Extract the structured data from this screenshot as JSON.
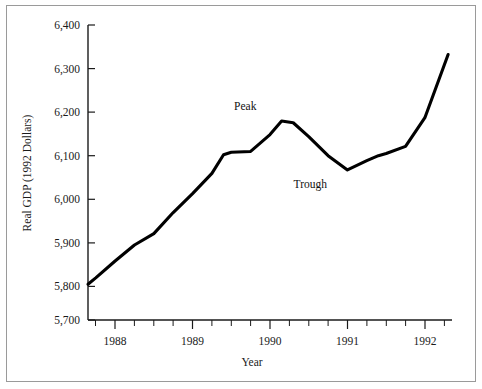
{
  "chart_data": {
    "type": "line",
    "title": "",
    "xlabel": "Year",
    "ylabel": "Real GDP (1992 Dollars)",
    "xlim": [
      1987.65,
      1992.35
    ],
    "ylim": [
      5700,
      6400
    ],
    "grid": false,
    "legend": null,
    "y_ticks": [
      "5,700",
      "5,800",
      "5,900",
      "6,000",
      "6,100",
      "6,200",
      "6,300",
      "6,400"
    ],
    "y_tick_values": [
      5700,
      5800,
      5900,
      6000,
      6100,
      6200,
      6300,
      6400
    ],
    "x_ticks": [
      "1988",
      "1989",
      "1990",
      "1991",
      "1992"
    ],
    "x_tick_values": [
      1988,
      1989,
      1990,
      1991,
      1992
    ],
    "x_minor_interval": 0.25,
    "series_name": "Real GDP",
    "line_color": "#000000",
    "x": [
      1987.65,
      1987.75,
      1988.0,
      1988.25,
      1988.5,
      1988.75,
      1989.0,
      1989.25,
      1989.4,
      1989.5,
      1989.75,
      1990.0,
      1990.15,
      1990.3,
      1990.5,
      1990.75,
      1991.0,
      1991.25,
      1991.4,
      1991.5,
      1991.75,
      1992.0,
      1992.3
    ],
    "y": [
      5785,
      5800,
      5840,
      5878,
      5905,
      5955,
      6000,
      6048,
      6092,
      6098,
      6100,
      6140,
      6172,
      6168,
      6135,
      6090,
      6056,
      6078,
      6090,
      6095,
      6112,
      6180,
      6330
    ],
    "annotations": [
      {
        "label": "Peak",
        "x": 1989.68,
        "y": 6172,
        "position": "above"
      },
      {
        "label": "Trough",
        "x": 1990.52,
        "y": 6056,
        "position": "below"
      }
    ]
  }
}
